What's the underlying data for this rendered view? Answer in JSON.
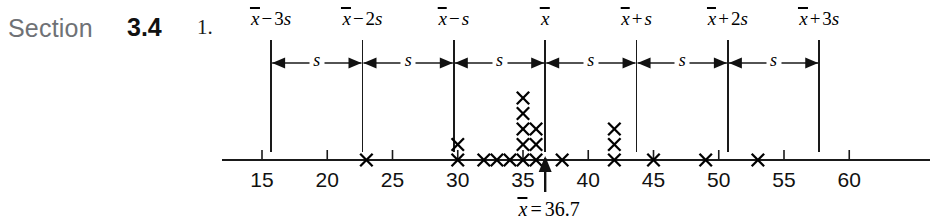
{
  "header": {
    "section_word": "Section",
    "section_number": "3.4",
    "problem_number": "1."
  },
  "chart_data": {
    "type": "scatter",
    "title": "",
    "xlabel": "",
    "ylabel": "",
    "xlim": [
      13,
      62
    ],
    "xticks": [
      15,
      20,
      25,
      30,
      35,
      40,
      45,
      50,
      55,
      60
    ],
    "xtick_labels": [
      "15",
      "20",
      "25",
      "30",
      "35",
      "40",
      "45",
      "50",
      "55",
      "60"
    ],
    "grid": false,
    "legend": false,
    "mean": 36.7,
    "mean_label_xbar": "x",
    "mean_label_eq": "=",
    "mean_label_value": "36.7",
    "std_dev": 7.0,
    "reference_lines": [
      {
        "value": 15.7,
        "label_xbar": "x",
        "label_op": "−",
        "label_coef": "3",
        "label_s": "s"
      },
      {
        "value": 22.7,
        "label_xbar": "x",
        "label_op": "−",
        "label_coef": "2",
        "label_s": "s"
      },
      {
        "value": 29.7,
        "label_xbar": "x",
        "label_op": "−",
        "label_coef": "",
        "label_s": "s"
      },
      {
        "value": 36.7,
        "label_xbar": "x",
        "label_op": "",
        "label_coef": "",
        "label_s": ""
      },
      {
        "value": 43.7,
        "label_xbar": "x",
        "label_op": "+",
        "label_coef": "",
        "label_s": "s"
      },
      {
        "value": 50.7,
        "label_xbar": "x",
        "label_op": "+",
        "label_coef": "2",
        "label_s": "s"
      },
      {
        "value": 57.7,
        "label_xbar": "x",
        "label_op": "+",
        "label_coef": "3",
        "label_s": "s"
      }
    ],
    "span_label": "s",
    "span_labels": [
      "s",
      "s",
      "s",
      "s",
      "s",
      "s"
    ],
    "dotplot_marker": "x",
    "dotplot_stacks": [
      {
        "value": 23,
        "count": 1
      },
      {
        "value": 30,
        "count": 2
      },
      {
        "value": 32,
        "count": 1
      },
      {
        "value": 33,
        "count": 1
      },
      {
        "value": 34,
        "count": 1
      },
      {
        "value": 35,
        "count": 5
      },
      {
        "value": 36,
        "count": 3
      },
      {
        "value": 38,
        "count": 1
      },
      {
        "value": 42,
        "count": 3
      },
      {
        "value": 45,
        "count": 1
      },
      {
        "value": 49,
        "count": 1
      },
      {
        "value": 53,
        "count": 1
      }
    ]
  },
  "colors": {
    "ink": "#111111",
    "section_gray": "#6f7276",
    "background": "#ffffff"
  }
}
